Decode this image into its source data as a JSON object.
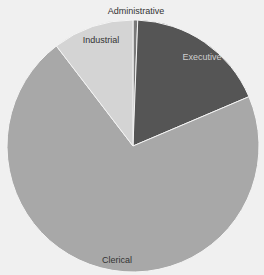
{
  "chart_data": {
    "type": "pie",
    "title": "",
    "start_angle_deg": 0,
    "direction": "clockwise",
    "categories": [
      "Administrative",
      "Executive",
      "Clerical",
      "Industrial"
    ],
    "values": [
      0.6,
      18.0,
      71.0,
      10.4
    ],
    "unit": "percent (estimated)",
    "colors": [
      "#7a7a7a",
      "#555555",
      "#a8a8a8",
      "#d4d4d4"
    ],
    "legend": "none (data labels on slices)"
  },
  "layout": {
    "cx": 133,
    "cy": 146,
    "r": 126,
    "background": "#f0f0f0"
  },
  "labels": [
    {
      "text": "Administrative",
      "x": 136,
      "y": 11,
      "light": false
    },
    {
      "text": "Executive",
      "x": 202,
      "y": 57,
      "light": true
    },
    {
      "text": "Clerical",
      "x": 117,
      "y": 260,
      "light": false
    },
    {
      "text": "Industrial",
      "x": 101,
      "y": 40,
      "light": false
    }
  ]
}
